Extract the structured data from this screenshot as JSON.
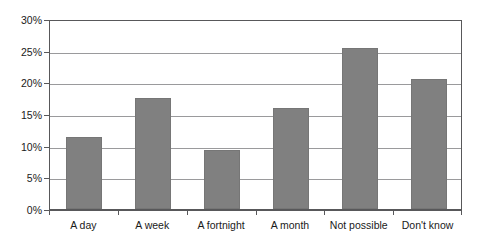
{
  "chart_data": {
    "type": "bar",
    "title": "",
    "subtitle": "",
    "xlabel": "",
    "ylabel": "",
    "categories": [
      "A day",
      "A week",
      "A fortnight",
      "A month",
      "Not possible",
      "Don't know"
    ],
    "values": [
      11.4,
      17.6,
      9.3,
      15.9,
      25.5,
      20.5
    ],
    "value_suffix": "%",
    "ylim": [
      0,
      30
    ],
    "ytick_values": [
      0,
      5,
      10,
      15,
      20,
      25,
      30
    ],
    "ytick_labels": [
      "0%",
      "5%",
      "10%",
      "15%",
      "20%",
      "25%",
      "30%"
    ],
    "grid": true,
    "grid_axis": "y",
    "legend": false,
    "legend_position": "none",
    "annotations": [],
    "colors": {
      "bar_fill": "#808080",
      "bar_stroke": "#767676",
      "gridline": "#9a9a9c",
      "axis": "#58585a",
      "text": "#1a1a1a",
      "background": "#ffffff"
    }
  }
}
